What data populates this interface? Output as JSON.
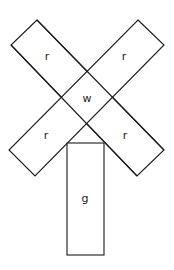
{
  "diagram": {
    "regions": {
      "arm_top_left": {
        "label": "r",
        "label_pos": [
          47,
          57
        ]
      },
      "arm_top_right": {
        "label": "r",
        "label_pos": [
          124,
          57
        ]
      },
      "center": {
        "label": "w",
        "label_pos": [
          87,
          99
        ]
      },
      "arm_bottom_left": {
        "label": "r",
        "label_pos": [
          46,
          136
        ]
      },
      "arm_bottom_right": {
        "label": "r",
        "label_pos": [
          125,
          136
        ]
      },
      "stem": {
        "label": "g",
        "label_pos": [
          85,
          199
        ]
      }
    },
    "colors": {
      "stroke": "#1a1a1a",
      "fill": "#ffffff"
    }
  }
}
